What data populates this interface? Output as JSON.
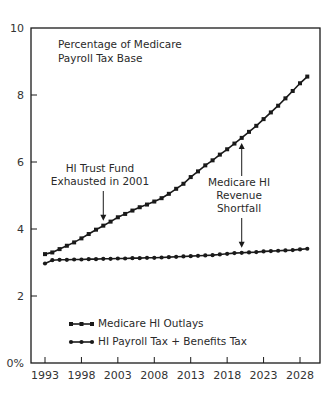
{
  "chart_data": {
    "type": "line",
    "title": "Percentage of Medicare Payroll Tax Base",
    "title_lines": [
      "Percentage of Medicare",
      "Payroll Tax Base"
    ],
    "xlabel": "",
    "ylabel": "",
    "ylim": [
      0,
      10
    ],
    "xlim": [
      1993,
      2029
    ],
    "y_ticks": [
      0,
      2,
      4,
      6,
      8,
      10
    ],
    "y_tick_labels": [
      "0%",
      "2",
      "4",
      "6",
      "8",
      "10"
    ],
    "x_ticks": [
      1993,
      1998,
      2003,
      2008,
      2013,
      2018,
      2023,
      2028
    ],
    "x_tick_labels": [
      "1993",
      "1998",
      "2003",
      "2008",
      "2013",
      "2018",
      "2023",
      "2028"
    ],
    "grid": false,
    "legend_position": "lower left (inside)",
    "x": [
      1993,
      1994,
      1995,
      1996,
      1997,
      1998,
      1999,
      2000,
      2001,
      2002,
      2003,
      2004,
      2005,
      2006,
      2007,
      2008,
      2009,
      2010,
      2011,
      2012,
      2013,
      2014,
      2015,
      2016,
      2017,
      2018,
      2019,
      2020,
      2021,
      2022,
      2023,
      2024,
      2025,
      2026,
      2027,
      2028,
      2029
    ],
    "series": [
      {
        "name": "Medicare HI Outlays",
        "marker": "square",
        "values": [
          3.25,
          3.3,
          3.4,
          3.5,
          3.6,
          3.72,
          3.85,
          3.98,
          4.1,
          4.22,
          4.35,
          4.45,
          4.55,
          4.65,
          4.73,
          4.82,
          4.92,
          5.05,
          5.2,
          5.35,
          5.55,
          5.72,
          5.9,
          6.05,
          6.22,
          6.38,
          6.55,
          6.72,
          6.9,
          7.08,
          7.28,
          7.48,
          7.68,
          7.9,
          8.12,
          8.35,
          8.55
        ]
      },
      {
        "name": "HI Payroll Tax + Benefits Tax",
        "marker": "circle",
        "values": [
          2.97,
          3.07,
          3.08,
          3.08,
          3.09,
          3.09,
          3.1,
          3.1,
          3.11,
          3.11,
          3.12,
          3.12,
          3.13,
          3.13,
          3.14,
          3.14,
          3.15,
          3.16,
          3.17,
          3.18,
          3.19,
          3.2,
          3.21,
          3.22,
          3.24,
          3.26,
          3.28,
          3.29,
          3.3,
          3.31,
          3.33,
          3.34,
          3.35,
          3.36,
          3.37,
          3.39,
          3.41
        ]
      }
    ],
    "annotations": [
      {
        "text_lines": [
          "HI Trust Fund",
          "Exhausted in 2001"
        ],
        "arrow_to": {
          "x": 2001,
          "y": 4.1
        }
      },
      {
        "text_lines": [
          "Medicare HI",
          "Revenue",
          "Shortfall"
        ],
        "arrows_to": [
          {
            "x": 2020,
            "y": 6.72
          },
          {
            "x": 2020,
            "y": 3.29
          }
        ]
      }
    ]
  },
  "colors": {
    "line": "#1a1a1a",
    "axis": "#1a1a1a",
    "text": "#2a2a2a",
    "background": "#ffffff"
  }
}
